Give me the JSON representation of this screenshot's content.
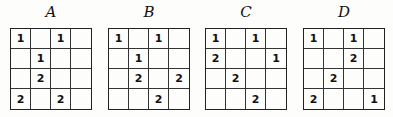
{
  "panels": [
    {
      "label": "A",
      "left": 10,
      "grid": [
        [
          "1",
          "",
          "1",
          ""
        ],
        [
          "",
          "1",
          "",
          ""
        ],
        [
          "",
          "2",
          "",
          ""
        ],
        [
          "2",
          "",
          "2",
          ""
        ]
      ]
    },
    {
      "label": "B",
      "left": 108,
      "grid": [
        [
          "1",
          "",
          "1",
          ""
        ],
        [
          "",
          "1",
          "",
          ""
        ],
        [
          "",
          "2",
          "",
          "2"
        ],
        [
          "",
          "",
          "2",
          ""
        ]
      ]
    },
    {
      "label": "C",
      "left": 205,
      "grid": [
        [
          "1",
          "",
          "1",
          ""
        ],
        [
          "2",
          "",
          "",
          "1"
        ],
        [
          "",
          "2",
          "",
          ""
        ],
        [
          "",
          "",
          "2",
          ""
        ]
      ]
    },
    {
      "label": "D",
      "left": 303,
      "grid": [
        [
          "1",
          "",
          "1",
          ""
        ],
        [
          "",
          "",
          "2",
          ""
        ],
        [
          "",
          "2",
          "",
          ""
        ],
        [
          "2",
          "",
          "",
          "1"
        ]
      ]
    }
  ]
}
